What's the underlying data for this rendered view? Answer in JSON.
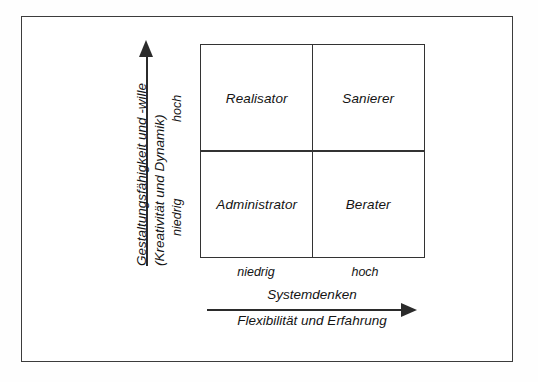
{
  "figure": {
    "type": "2x2-matrix-diagram",
    "background_color": "#ffffff",
    "line_color": "#333333"
  },
  "y_axis": {
    "title_line_1": "Gestaltungsfähigkeit und -wille",
    "title_line_2": "(Kreativität und Dynamik)",
    "ticks": {
      "high": "hoch",
      "low": "niedrig"
    },
    "arrow_direction": "up"
  },
  "x_axis": {
    "title_line_1": "Systemdenken",
    "title_line_2": "Flexibilität und Erfahrung",
    "ticks": {
      "low": "niedrig",
      "high": "hoch"
    },
    "arrow_direction": "right"
  },
  "matrix": {
    "quadrants": [
      {
        "position": "top-left",
        "label": "Realisator"
      },
      {
        "position": "top-right",
        "label": "Sanierer"
      },
      {
        "position": "bottom-left",
        "label": "Administrator"
      },
      {
        "position": "bottom-right",
        "label": "Berater"
      }
    ]
  },
  "chart_data": {
    "type": "table",
    "title": "",
    "xlabel": "Systemdenken / Flexibilität und Erfahrung",
    "ylabel": "Gestaltungsfähigkeit und -wille / (Kreativität und Dynamik)",
    "x_categories": [
      "niedrig",
      "hoch"
    ],
    "y_categories": [
      "niedrig",
      "hoch"
    ],
    "cells": [
      {
        "x": "niedrig",
        "y": "hoch",
        "value": "Realisator"
      },
      {
        "x": "hoch",
        "y": "hoch",
        "value": "Sanierer"
      },
      {
        "x": "niedrig",
        "y": "niedrig",
        "value": "Administrator"
      },
      {
        "x": "hoch",
        "y": "niedrig",
        "value": "Berater"
      }
    ],
    "grid": true,
    "legend": "none"
  }
}
